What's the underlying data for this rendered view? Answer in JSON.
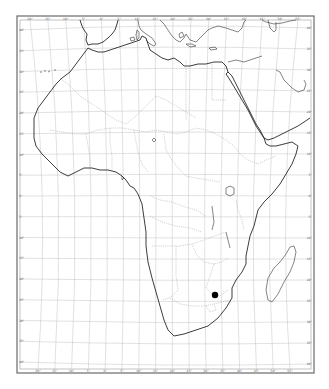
{
  "map": {
    "title": "",
    "subject": "Africa outline map",
    "colors": {
      "background": "#ffffff",
      "coastline": "#1a1a1a",
      "graticule": "#bdbdbd",
      "borders": "#9a9a9a",
      "frame": "#6a6a6a",
      "marker": "#000000"
    },
    "frame": {
      "x": 18,
      "y": 17,
      "width": 295,
      "height": 355
    },
    "longitude_labels_top": [
      "20°",
      "15°",
      "10°",
      "5°",
      "0°",
      "5°",
      "10°",
      "15°",
      "20°",
      "25°",
      "30°",
      "35°",
      "40°",
      "45°",
      "50°",
      "55°"
    ],
    "longitude_labels_bottom": [
      "20°",
      "15°",
      "10°",
      "5°",
      "0°",
      "5°",
      "10°",
      "15°",
      "20°",
      "25°",
      "30°",
      "35°",
      "40°",
      "45°",
      "50°",
      "55°"
    ],
    "latitude_labels_left": [
      "40°",
      "35°",
      "30°",
      "25°",
      "20°",
      "15°",
      "10°",
      "5°",
      "0°",
      "5°",
      "10°",
      "15°",
      "20°",
      "25°",
      "30°",
      "35°",
      "40°"
    ],
    "latitude_labels_right": [
      "40°",
      "35°",
      "30°",
      "25°",
      "20°",
      "15°",
      "10°",
      "5°",
      "0°",
      "5°",
      "10°",
      "15°",
      "20°",
      "25°",
      "30°",
      "35°",
      "40°"
    ],
    "marker": {
      "label": "location-marker",
      "x": 215,
      "y": 295,
      "r": 3.2
    }
  }
}
